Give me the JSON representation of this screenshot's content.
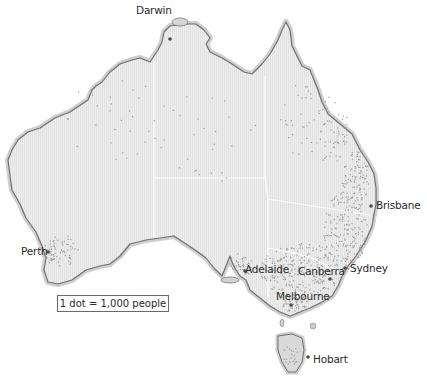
{
  "map": {
    "type": "dot-density population map",
    "region": "Australia",
    "colors": {
      "land": "#ececec",
      "coast_halo": "#c9c9c9",
      "coastline": "#707070",
      "state_border": "#ffffff",
      "dot": "#9a9a9a",
      "city_marker": "#4a4a4a",
      "label": "#2a2a2a"
    }
  },
  "legend": {
    "text": "1 dot = 1,000 people"
  },
  "cities": [
    {
      "name": "Darwin",
      "label_x": 136,
      "label_y": 5,
      "dot_x": 170,
      "dot_y": 39
    },
    {
      "name": "Perth",
      "label_x": 21,
      "label_y": 246,
      "dot_x": 48,
      "dot_y": 252
    },
    {
      "name": "Brisbane",
      "label_x": 376,
      "label_y": 200,
      "dot_x": 371,
      "dot_y": 206
    },
    {
      "name": "Adelaide",
      "label_x": 244,
      "label_y": 264,
      "dot_x": 245,
      "dot_y": 271
    },
    {
      "name": "Canberra",
      "label_x": 298,
      "label_y": 266,
      "dot_x": 330,
      "dot_y": 279
    },
    {
      "name": "Sydney",
      "label_x": 350,
      "label_y": 263,
      "dot_x": 345,
      "dot_y": 268
    },
    {
      "name": "Melbourne",
      "label_x": 276,
      "label_y": 291,
      "dot_x": 291,
      "dot_y": 305
    },
    {
      "name": "Hobart",
      "label_x": 313,
      "label_y": 354,
      "dot_x": 308,
      "dot_y": 357
    }
  ]
}
